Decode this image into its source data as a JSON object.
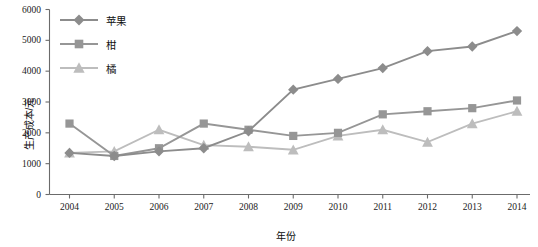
{
  "chart_data": {
    "type": "line",
    "title": "",
    "xlabel": "年份",
    "ylabel": "生产成本/元",
    "x": [
      2004,
      2005,
      2006,
      2007,
      2008,
      2009,
      2010,
      2011,
      2012,
      2013,
      2014
    ],
    "xtick_labels": [
      "2004",
      "2005",
      "2006",
      "2007",
      "2008",
      "2009",
      "2010",
      "2011",
      "2012",
      "2013",
      "2014"
    ],
    "ytick_labels": [
      "0",
      "1000",
      "2000",
      "3000",
      "4000",
      "5000",
      "6000"
    ],
    "yticks": [
      0,
      1000,
      2000,
      3000,
      4000,
      5000,
      6000
    ],
    "ylim": [
      0,
      6000
    ],
    "xlim": [
      2003.5,
      2014.5
    ],
    "grid": false,
    "legend_position": "top-left",
    "series": [
      {
        "name": "苹果",
        "marker": "diamond",
        "color": "#8c8c8c",
        "values": [
          1350,
          1250,
          1400,
          1500,
          2050,
          3400,
          3750,
          4100,
          4650,
          4800,
          5300
        ]
      },
      {
        "name": "柑",
        "marker": "square",
        "color": "#969696",
        "values": [
          2300,
          1250,
          1500,
          2300,
          2100,
          1900,
          2000,
          2600,
          2700,
          2800,
          3050
        ]
      },
      {
        "name": "橘",
        "marker": "triangle",
        "color": "#bdbdbd",
        "values": [
          1350,
          1400,
          2100,
          1600,
          1550,
          1450,
          1900,
          2100,
          1700,
          2300,
          2700
        ]
      }
    ]
  },
  "axes": {
    "axis_color": "#6b6b6b",
    "text_color": "#111111"
  }
}
